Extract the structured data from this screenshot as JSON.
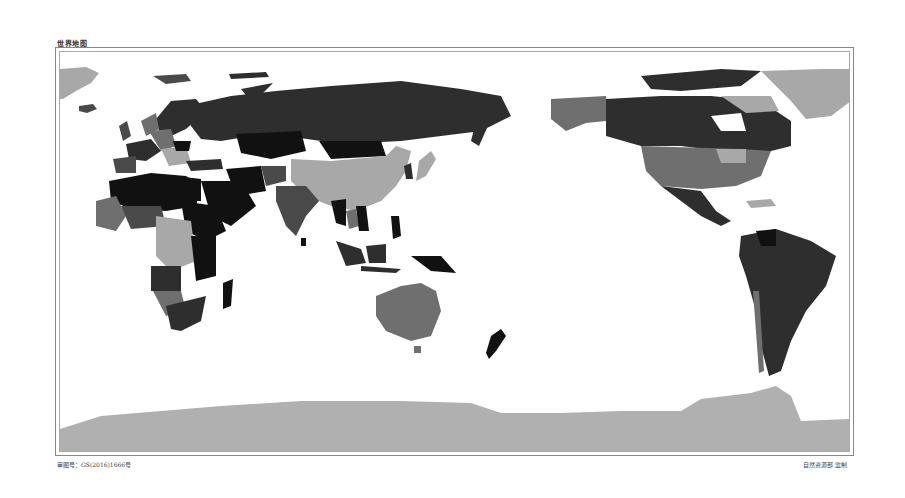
{
  "map": {
    "title": "世界地图",
    "approval_number": "审图号：GS(2016)1666号",
    "supervisor": "自然资源部 监制",
    "projection_center": "Pacific-centered",
    "color_scheme": "grayscale choropleth",
    "shades": {
      "black": "#111111",
      "dark": "#2e2e2e",
      "mid_dark": "#4a4a4a",
      "mid": "#6f6f6f",
      "light": "#a8a8a8",
      "antarctica": "#b0b0b0",
      "ocean": "#ffffff"
    }
  }
}
